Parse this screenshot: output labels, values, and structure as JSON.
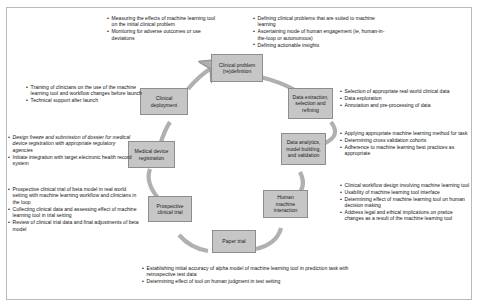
{
  "figure": {
    "node_fill": "#c6c6c6",
    "node_stroke": "#8d8d8d",
    "arrow_fill": "#b0b0b0",
    "frame_stroke": "#b9b9b9"
  },
  "nodes": [
    {
      "id": "clinical-problem-redefinition",
      "label": "Clinical problem (re)definition"
    },
    {
      "id": "data-extraction-selection-refining",
      "label": "Data extraction, selection and refining"
    },
    {
      "id": "data-analytics-model-building-validation",
      "label": "Data analytics, model building, and validation"
    },
    {
      "id": "human-machine-interaction",
      "label": "Human machine interaction"
    },
    {
      "id": "paper-trial",
      "label": "Paper trial"
    },
    {
      "id": "prospective-clinical-trial",
      "label": "Prospective clinical trial"
    },
    {
      "id": "medical-device-registration",
      "label": "Medical device registration"
    },
    {
      "id": "clinical-deployment",
      "label": "Clinical deployment"
    }
  ],
  "annotations": {
    "clinical_deployment": [
      "Measuring the effects of machine learning tool on the initial clinical problem",
      "Monitoring for adverse outcomes or use deviations"
    ],
    "clinical_problem": [
      "Defining clinical problems that are suited to machine learning",
      "Ascertaining mode of human engagement (ie, human-in-the-loop or autonomous)",
      "Defining actionable insights"
    ],
    "data_extraction": [
      "Selection of appropriate real world clinical data",
      "Data exploration",
      "Annotation and pre-processing of data"
    ],
    "data_analytics": [
      "Applying appropriate machine learning method for task",
      "Determining cross validation cohorts",
      "Adherence to machine learning best practices as appropriate"
    ],
    "human_machine": [
      "Clinical workflow design involving machine learning tool",
      "Usability of machine learning tool interface",
      "Determining effect of machine learning tool on human decision making",
      "Address legal and ethical implications on pratice changes as a result of the machine learning tool"
    ],
    "paper_trial": [
      "Establishing initial accuracy of alpha model of machine learning tool in prediction task with retrospective test data",
      "Determining effect of tool on human judgment in test setting"
    ],
    "prospective_trial": [
      "Prospective clinical trial of beta model in real world setting with machine learning workflow and clinicians in the loop",
      "Collecting clinical data and assessing effect of machine learning tool in trial setting",
      "Review of clinical trial data and final adjustments of beta model"
    ],
    "device_registration": [
      "Design freeze and submission of dossier for medical device registration with appropriate regulatory agencies",
      "Initiate integration with target electronic health record system"
    ],
    "training": [
      "Training of clinicians on the use of the machine learning tool and workflow changes before launch",
      "Technical support after launch"
    ]
  }
}
